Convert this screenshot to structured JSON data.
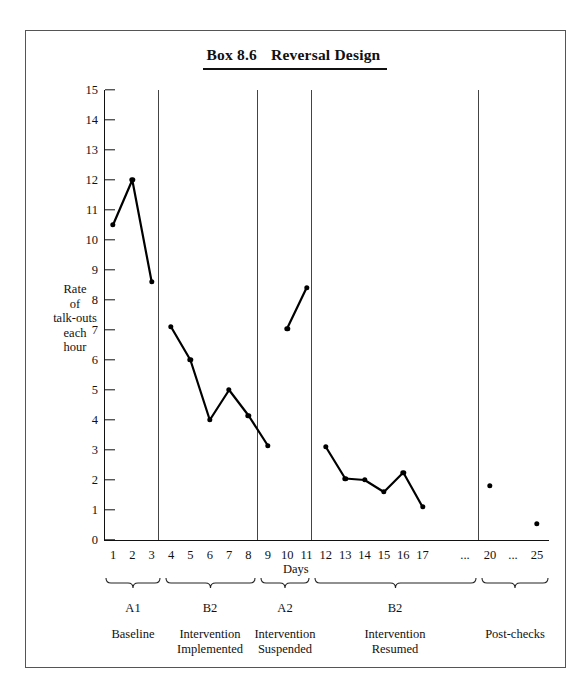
{
  "figure": {
    "box_number": "Box 8.6",
    "title": "Reversal Design"
  },
  "chart_data": {
    "type": "line",
    "xlabel": "Days",
    "ylabel": "Rate of talk-outs each hour",
    "ylabel_lines": [
      "Rate",
      "of",
      "talk-outs",
      "each",
      "hour"
    ],
    "xlim": [
      0,
      25
    ],
    "ylim": [
      0,
      15
    ],
    "grid": false,
    "legend": "none",
    "ytick_labels": [
      "0",
      "1",
      "2",
      "3",
      "4",
      "5",
      "6",
      "7",
      "8",
      "9",
      "10",
      "11",
      "12",
      "13",
      "14",
      "15"
    ],
    "xtick_labels": [
      "1",
      "2",
      "3",
      "4",
      "5",
      "6",
      "7",
      "8",
      "9",
      "10",
      "11",
      "12",
      "13",
      "14",
      "15",
      "16",
      "17",
      "...",
      "20",
      "...",
      "25"
    ],
    "series": [
      {
        "name": "A1 Baseline",
        "x": [
          1,
          2,
          3
        ],
        "values": [
          10.5,
          12.0,
          8.6
        ],
        "connected": true
      },
      {
        "name": "B2 Intervention Implemented",
        "x": [
          4,
          5,
          6,
          7,
          8,
          9
        ],
        "values": [
          7.1,
          6.0,
          4.0,
          5.0,
          4.15,
          3.15
        ],
        "connected": true
      },
      {
        "name": "A2 Intervention Suspended",
        "x": [
          10,
          11
        ],
        "values": [
          7.05,
          8.4
        ],
        "connected": true
      },
      {
        "name": "B2 Intervention Resumed",
        "x": [
          12,
          13,
          14,
          15,
          16,
          17
        ],
        "values": [
          3.1,
          2.05,
          2.0,
          1.6,
          2.25,
          1.1
        ],
        "connected": true
      },
      {
        "name": "Post-checks",
        "x": [
          20,
          25
        ],
        "values": [
          1.8,
          0.55
        ],
        "connected": false
      }
    ],
    "phases": [
      {
        "code": "A1",
        "name": "Baseline",
        "days": [
          1,
          3
        ]
      },
      {
        "code": "B2",
        "name": "Intervention Implemented",
        "days": [
          4,
          9
        ]
      },
      {
        "code": "A2",
        "name": "Intervention Suspended",
        "days": [
          10,
          11
        ]
      },
      {
        "code": "B2",
        "name": "Intervention Resumed",
        "days": [
          12,
          17
        ]
      },
      {
        "code": "",
        "name": "Post-checks",
        "days": [
          20,
          25
        ]
      }
    ],
    "phase_labels": [
      "A1",
      "B2",
      "A2",
      "B2"
    ],
    "phase_names": [
      "Baseline",
      "Intervention\nImplemented",
      "Intervention\nSuspended",
      "Intervention\nResumed",
      "Post-checks"
    ],
    "colors": {
      "line": "#000000",
      "marker": "#000000",
      "axis": "#111111",
      "separator": "#444444"
    }
  }
}
